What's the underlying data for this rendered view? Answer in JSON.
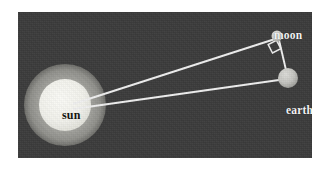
{
  "figure": {
    "background_color": "#3b3b3b",
    "page_color": "#ffffff",
    "line_color": "#f0f0f0"
  },
  "panel": {
    "x": 18,
    "y": 12,
    "width": 294,
    "height": 146
  },
  "bodies": {
    "sun": {
      "label": "sun",
      "cx": 47,
      "cy": 93,
      "core_radius": 26,
      "corona_radius": 41,
      "core_color": "#f3f3ef",
      "corona_color": "#a8a8a4",
      "label_color": "#16160f"
    },
    "earth": {
      "label": "earth",
      "cx": 270,
      "cy": 66,
      "radius": 10,
      "color": "#c8c8c4",
      "label_color": "#f2f2f2"
    },
    "moon": {
      "label": "moon",
      "cx": 259,
      "cy": 24,
      "radius": 5.5,
      "color": "#d2d2ce",
      "label_color": "#f2f2f2"
    }
  },
  "lines": [
    {
      "name": "sun-to-moon",
      "x1": 55,
      "y1": 92,
      "x2": 257,
      "y2": 27
    },
    {
      "name": "sun-to-earth",
      "x1": 55,
      "y1": 97,
      "x2": 261,
      "y2": 68
    },
    {
      "name": "moon-to-earth",
      "x1": 261,
      "y1": 28,
      "x2": 268,
      "y2": 58
    }
  ],
  "right_angle_marker": {
    "name": "right-angle-at-moon",
    "points": "250.2,32.6 254.5,41.0 262.8,36.6 258.5,28.3"
  }
}
